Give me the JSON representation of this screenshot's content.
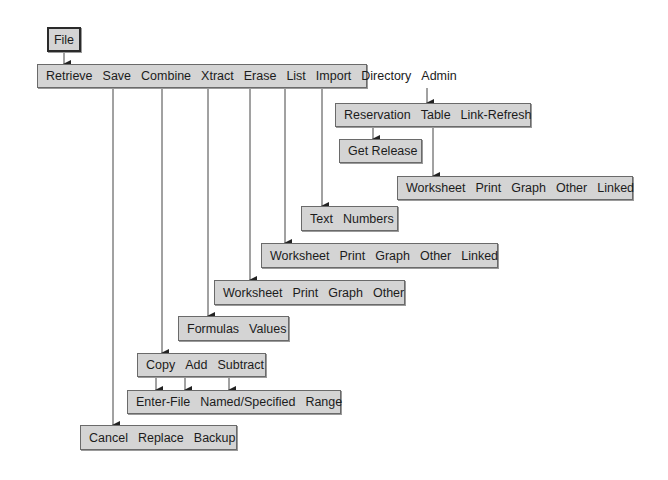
{
  "root": {
    "label": "File"
  },
  "main_menu": {
    "items": [
      "Retrieve",
      "Save",
      "Combine",
      "Xtract",
      "Erase",
      "List",
      "Import",
      "Directory",
      "Admin"
    ]
  },
  "admin_menu": {
    "items": [
      "Reservation",
      "Table",
      "Link-Refresh"
    ]
  },
  "reservation_menu": {
    "items": [
      "Get Release"
    ]
  },
  "table_menu": {
    "items": [
      "Worksheet",
      "Print",
      "Graph",
      "Other",
      "Linked"
    ]
  },
  "import_menu": {
    "items": [
      "Text",
      "Numbers"
    ]
  },
  "list_menu": {
    "items": [
      "Worksheet",
      "Print",
      "Graph",
      "Other",
      "Linked"
    ]
  },
  "erase_menu": {
    "items": [
      "Worksheet",
      "Print",
      "Graph",
      "Other"
    ]
  },
  "xtract_menu": {
    "items": [
      "Formulas",
      "Values"
    ]
  },
  "combine_menu": {
    "items": [
      "Copy",
      "Add",
      "Subtract"
    ]
  },
  "combine_target_menu": {
    "items": [
      "Enter-File",
      "Named/Specified",
      "Range"
    ]
  },
  "save_menu": {
    "items": [
      "Cancel",
      "Replace",
      "Backup"
    ]
  },
  "colors": {
    "box_fill": "#d4d4d4",
    "box_border": "#6a6a6a",
    "line": "#333333",
    "text": "#1c1c1c"
  }
}
